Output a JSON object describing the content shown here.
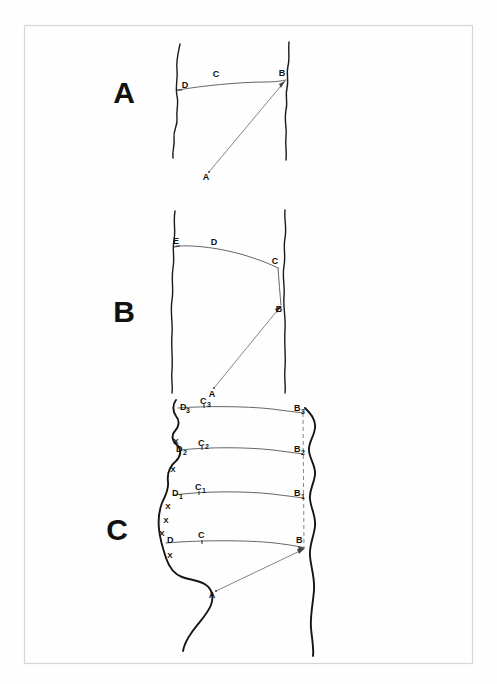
{
  "figure": {
    "background_color": "#fefefe",
    "frame_color": "#d6d6d6",
    "ink_color": "#1a1a1a",
    "trace_color": "#555555"
  },
  "panels": [
    {
      "id": "A",
      "label": "A",
      "label_x": 124,
      "label_y": 103,
      "points": [
        {
          "name": "A",
          "base": "A",
          "sub": "",
          "x": 209,
          "y": 175,
          "label_x": 206,
          "label_y": 175
        },
        {
          "name": "B",
          "base": "B",
          "sub": "",
          "x": 284,
          "y": 80,
          "label_x": 281,
          "label_y": 78
        },
        {
          "name": "C",
          "base": "C",
          "sub": "",
          "x": 219,
          "y": 79,
          "label_x": 215,
          "label_y": 79
        },
        {
          "name": "D",
          "base": "D",
          "sub": "",
          "x": 186,
          "y": 90,
          "label_x": 183,
          "label_y": 89
        }
      ]
    },
    {
      "id": "B",
      "label": "B",
      "label_x": 124,
      "label_y": 322,
      "points": [
        {
          "name": "A",
          "base": "A",
          "sub": "",
          "x": 213,
          "y": 392,
          "label_x": 210,
          "label_y": 392
        },
        {
          "name": "B",
          "base": "B",
          "sub": "",
          "x": 281,
          "y": 308,
          "label_x": 278,
          "label_y": 307
        },
        {
          "name": "C",
          "base": "C",
          "sub": "",
          "x": 277,
          "y": 265,
          "label_x": 273,
          "label_y": 264
        },
        {
          "name": "D",
          "base": "D",
          "sub": "",
          "x": 215,
          "y": 243,
          "label_x": 212,
          "label_y": 243
        },
        {
          "name": "E",
          "base": "E",
          "sub": "",
          "x": 177,
          "y": 246,
          "label_x": 174,
          "label_y": 245
        }
      ]
    },
    {
      "id": "C",
      "label": "C",
      "label_x": 117,
      "label_y": 540,
      "points": [
        {
          "name": "A",
          "base": "A",
          "sub": "",
          "x": 215,
          "y": 594,
          "label_x": 211,
          "label_y": 595
        },
        {
          "name": "B",
          "base": "B",
          "sub": "",
          "x": 303,
          "y": 546,
          "label_x": 299,
          "label_y": 543
        },
        {
          "name": "C",
          "base": "C",
          "sub": "",
          "x": 201,
          "y": 538,
          "label_x": 197,
          "label_y": 538
        },
        {
          "name": "D",
          "base": "D",
          "sub": "",
          "x": 172,
          "y": 542,
          "label_x": 168,
          "label_y": 542
        },
        {
          "name": "B1",
          "base": "B",
          "sub": "1",
          "x": 303,
          "y": 496,
          "label_x": 299,
          "label_y": 493
        },
        {
          "name": "C1",
          "base": "C",
          "sub": "1",
          "x": 198,
          "y": 489,
          "label_x": 194,
          "label_y": 489
        },
        {
          "name": "D1",
          "base": "D",
          "sub": "1",
          "x": 176,
          "y": 494,
          "label_x": 171,
          "label_y": 494
        },
        {
          "name": "B2",
          "base": "B",
          "sub": "2",
          "x": 303,
          "y": 452,
          "label_x": 299,
          "label_y": 450
        },
        {
          "name": "C2",
          "base": "C",
          "sub": "2",
          "x": 201,
          "y": 444,
          "label_x": 197,
          "label_y": 444
        },
        {
          "name": "D2",
          "base": "D",
          "sub": "2",
          "x": 182,
          "y": 449,
          "label_x": 177,
          "label_y": 449
        },
        {
          "name": "B3",
          "base": "B",
          "sub": "3",
          "x": 303,
          "y": 412,
          "label_x": 299,
          "label_y": 410
        },
        {
          "name": "C3",
          "base": "C",
          "sub": "3",
          "x": 203,
          "y": 406,
          "label_x": 199,
          "label_y": 406
        },
        {
          "name": "D3",
          "base": "D",
          "sub": "3",
          "x": 182,
          "y": 408,
          "label_x": 177,
          "label_y": 408
        }
      ],
      "x_markers": [
        {
          "label": "X",
          "x": 176,
          "y": 442
        },
        {
          "label": "X",
          "x": 173,
          "y": 470
        },
        {
          "label": "X",
          "x": 168,
          "y": 507
        },
        {
          "label": "X",
          "x": 166,
          "y": 520
        },
        {
          "label": "X",
          "x": 163,
          "y": 533
        },
        {
          "label": "X",
          "x": 170,
          "y": 556
        }
      ]
    }
  ]
}
